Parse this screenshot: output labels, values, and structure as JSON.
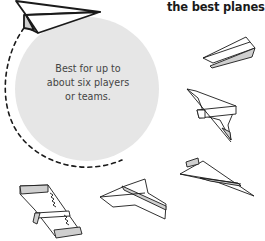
{
  "heading": {
    "text": "the best planes and"
  },
  "callout": {
    "lines": [
      "Best for up to",
      "about six players",
      "or teams."
    ]
  },
  "colors": {
    "circle_fill": "#e6e6e6",
    "stroke": "#1a1a1a",
    "plane_shade": "#cfcfcf",
    "text": "#444444"
  },
  "illustrations": [
    {
      "name": "paper-plane-dart-top-left"
    },
    {
      "name": "paper-plane-glider-right"
    },
    {
      "name": "paper-plane-jet-right"
    },
    {
      "name": "paper-plane-dart-lower-right"
    },
    {
      "name": "paper-plane-flat-glider-bottom-left"
    },
    {
      "name": "paper-plane-delta-bottom-center"
    }
  ]
}
